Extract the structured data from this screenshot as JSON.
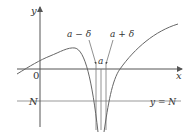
{
  "figure": {
    "labels": {
      "y_axis": "y",
      "x_axis": "x",
      "origin": "0",
      "n_tick": "N",
      "line_eq": "y = N",
      "a_minus_delta": "a − δ",
      "a_plus_delta": "a + δ",
      "a": "a"
    },
    "colors": {
      "axis": "#555555",
      "curve": "#666666",
      "guide": "#999999",
      "text": "#333333"
    }
  }
}
